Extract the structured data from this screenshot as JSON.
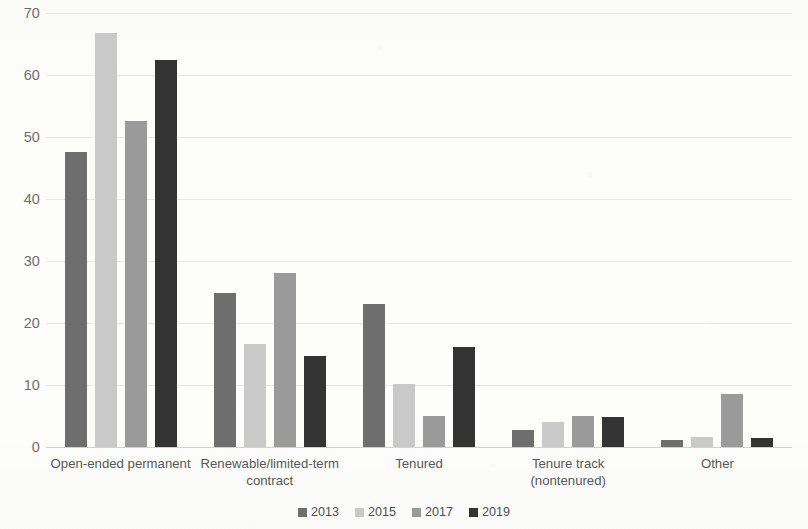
{
  "chart_data": {
    "type": "bar",
    "title": "",
    "xlabel": "",
    "ylabel": "",
    "ylim": [
      0,
      70
    ],
    "ytick_step": 10,
    "yticks": [
      "70",
      "60",
      "50",
      "40",
      "30",
      "20",
      "10",
      "0"
    ],
    "grid": true,
    "legend_position": "bottom",
    "categories": [
      "Open-ended permanent",
      "Renewable/limited-term contract",
      "Tenured",
      "Tenure track (nontenured)",
      "Other"
    ],
    "series": [
      {
        "name": "2013",
        "color": "#6e6e6e",
        "values": [
          47.6,
          24.8,
          23.0,
          2.8,
          1.2
        ]
      },
      {
        "name": "2015",
        "color": "#c9c9c9",
        "values": [
          66.8,
          16.6,
          10.2,
          4.0,
          1.6
        ]
      },
      {
        "name": "2017",
        "color": "#9a9a9a",
        "values": [
          52.6,
          28.0,
          5.0,
          5.0,
          8.6
        ]
      },
      {
        "name": "2019",
        "color": "#333333",
        "values": [
          62.4,
          14.6,
          16.2,
          4.8,
          1.4
        ]
      }
    ]
  }
}
